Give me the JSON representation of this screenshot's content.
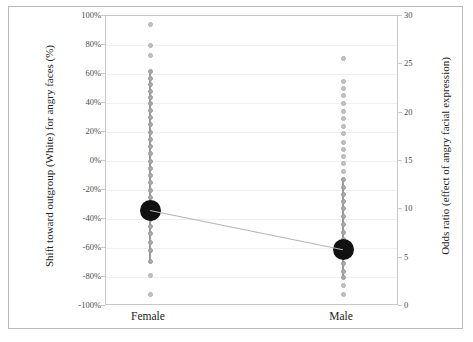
{
  "chart_data": {
    "type": "scatter",
    "title": "",
    "subtitle": "",
    "categories": [
      "Female",
      "Male"
    ],
    "xlabel": "",
    "ylabel": "Shift toward outgroup (White) for angry faces (%)",
    "y2label": "Odds ratio (effect of angry facial expression)",
    "ylim": [
      -100,
      100
    ],
    "yticks": [
      "-100%",
      "-80%",
      "-60%",
      "-40%",
      "-20%",
      "0%",
      "20%",
      "40%",
      "60%",
      "80%",
      "100%"
    ],
    "ytick_values": [
      -100,
      -80,
      -60,
      -40,
      -20,
      0,
      20,
      40,
      60,
      80,
      100
    ],
    "y2lim": [
      0,
      30
    ],
    "y2ticks": [
      "0",
      "5",
      "10",
      "15",
      "20",
      "25",
      "30"
    ],
    "y2tick_values": [
      0,
      5,
      10,
      15,
      20,
      25,
      30
    ],
    "grid": true,
    "legend": "none",
    "series": [
      {
        "name": "Female",
        "x": "Female",
        "mean": -34,
        "mean_odds_ratio": 9.9,
        "error_bar": [
          -69,
          62
        ],
        "points": [
          94,
          80,
          73,
          62,
          57,
          53,
          48,
          44,
          40,
          35,
          30,
          25,
          20,
          15,
          10,
          5,
          0,
          -5,
          -10,
          -15,
          -20,
          -25,
          -30,
          -34,
          -40,
          -45,
          -50,
          -56,
          -62,
          -69,
          -79,
          -92
        ]
      },
      {
        "name": "Male",
        "x": "Male",
        "mean": -61,
        "mean_odds_ratio": 5.9,
        "error_bar": [
          -80,
          -13
        ],
        "points": [
          71,
          55,
          50,
          45,
          40,
          34,
          29,
          24,
          19,
          13,
          8,
          3,
          -2,
          -7,
          -13,
          -18,
          -23,
          -28,
          -33,
          -38,
          -44,
          -49,
          -54,
          -61,
          -66,
          -71,
          -76,
          -80,
          -86,
          -92
        ]
      }
    ],
    "connector_line": {
      "from": -34,
      "to": -61,
      "color": "#b5b5b5"
    }
  },
  "colors": {
    "mean_marker": "#111111",
    "point": "#c2c2c2",
    "error_bar": "#9a9a9a",
    "grid": "#efefef",
    "axis": "#c9c9c9",
    "frame": "#b9b9b9",
    "text": "#222222"
  }
}
